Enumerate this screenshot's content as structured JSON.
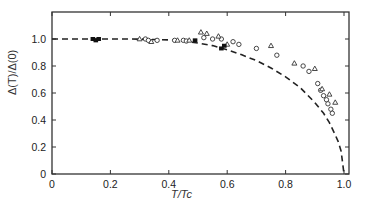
{
  "chart_data": {
    "type": "scatter",
    "title": "",
    "xlabel": "T/Tc",
    "ylabel": "Δ(T)/Δ(0)",
    "xlim": [
      0,
      1.0
    ],
    "ylim": [
      0,
      1.15
    ],
    "xticks": [
      0,
      0.2,
      0.4,
      0.6,
      0.8,
      1.0
    ],
    "xtick_labels": [
      "0",
      "0.2",
      "0.4",
      "0.6",
      "0.8",
      "1.0"
    ],
    "yticks": [
      0,
      0.2,
      0.4,
      0.6,
      0.8,
      1.0
    ],
    "ytick_labels": [
      "0",
      "0.2",
      "0.4",
      "0.6",
      "0.8",
      "1.0"
    ],
    "grid": false,
    "legend": null,
    "series": [
      {
        "name": "BCS theory",
        "style": "dashed-line",
        "x": [
          0,
          0.1,
          0.2,
          0.3,
          0.4,
          0.45,
          0.5,
          0.55,
          0.6,
          0.65,
          0.7,
          0.75,
          0.8,
          0.85,
          0.9,
          0.93,
          0.95,
          0.97,
          0.98,
          0.99,
          1.0
        ],
        "y": [
          1.0,
          1.0,
          1.0,
          0.999,
          0.993,
          0.985,
          0.97,
          0.951,
          0.92,
          0.883,
          0.84,
          0.785,
          0.72,
          0.64,
          0.53,
          0.45,
          0.38,
          0.29,
          0.24,
          0.17,
          0.0
        ]
      },
      {
        "name": "circles",
        "marker": "open-circle",
        "x": [
          0.32,
          0.33,
          0.36,
          0.42,
          0.45,
          0.46,
          0.52,
          0.55,
          0.58,
          0.62,
          0.64,
          0.7,
          0.77,
          0.86,
          0.88,
          0.91,
          0.92,
          0.93,
          0.94,
          0.945,
          0.955,
          0.96
        ],
        "y": [
          1.0,
          0.99,
          0.99,
          0.99,
          0.99,
          0.985,
          1.01,
          1.0,
          1.0,
          0.98,
          0.96,
          0.93,
          0.88,
          0.8,
          0.76,
          0.67,
          0.62,
          0.58,
          0.55,
          0.52,
          0.48,
          0.45
        ]
      },
      {
        "name": "triangles",
        "marker": "open-triangle",
        "x": [
          0.3,
          0.34,
          0.43,
          0.47,
          0.51,
          0.53,
          0.57,
          0.6,
          0.75,
          0.83,
          0.9,
          0.925,
          0.95,
          0.97
        ],
        "y": [
          1.0,
          0.98,
          0.99,
          0.99,
          1.05,
          1.04,
          1.02,
          0.96,
          0.95,
          0.82,
          0.78,
          0.63,
          0.59,
          0.53
        ]
      },
      {
        "name": "filled",
        "marker": "filled-square",
        "x": [
          0.14,
          0.15,
          0.16,
          0.49,
          0.58,
          0.59
        ],
        "y": [
          1.0,
          0.99,
          1.0,
          0.99,
          0.93,
          0.95
        ]
      }
    ]
  }
}
